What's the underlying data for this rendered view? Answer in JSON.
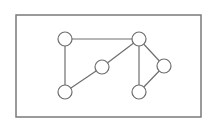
{
  "diagram": {
    "type": "undirected-graph",
    "frame": {
      "x": 16,
      "y": 15,
      "width": 185,
      "height": 102,
      "stroke": "#7a7a7a"
    },
    "node_style": {
      "radius": 7,
      "fill": "#ffffff",
      "stroke": "#6e6e6e"
    },
    "edge_style": {
      "stroke": "#6e6e6e"
    },
    "nodes": [
      {
        "id": "A",
        "x": 65,
        "y": 39
      },
      {
        "id": "B",
        "x": 139,
        "y": 39
      },
      {
        "id": "C",
        "x": 102,
        "y": 67
      },
      {
        "id": "D",
        "x": 164,
        "y": 66
      },
      {
        "id": "E",
        "x": 65,
        "y": 92
      },
      {
        "id": "F",
        "x": 139,
        "y": 92
      }
    ],
    "edges": [
      {
        "from": "A",
        "to": "B"
      },
      {
        "from": "A",
        "to": "E"
      },
      {
        "from": "E",
        "to": "C"
      },
      {
        "from": "C",
        "to": "B"
      },
      {
        "from": "B",
        "to": "F"
      },
      {
        "from": "B",
        "to": "D"
      },
      {
        "from": "D",
        "to": "F"
      }
    ]
  }
}
